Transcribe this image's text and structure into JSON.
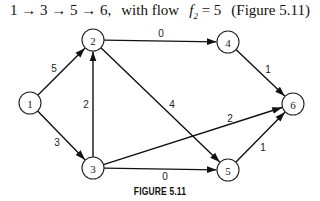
{
  "header": {
    "path": "1 → 3 → 5 → 6,",
    "with_flow_text": "with flow",
    "flow_var": "f",
    "flow_sub": "2",
    "flow_eq": " = 5",
    "figure_ref": "(Figure 5.11)"
  },
  "graph": {
    "nodes": [
      {
        "id": "1",
        "label": "1",
        "x": 30,
        "y": 103
      },
      {
        "id": "2",
        "label": "2",
        "x": 93,
        "y": 40
      },
      {
        "id": "3",
        "label": "3",
        "x": 93,
        "y": 168
      },
      {
        "id": "4",
        "label": "4",
        "x": 228,
        "y": 42
      },
      {
        "id": "5",
        "label": "5",
        "x": 228,
        "y": 170
      },
      {
        "id": "6",
        "label": "6",
        "x": 293,
        "y": 104
      }
    ],
    "edges": [
      {
        "from": "1",
        "to": "2",
        "label": "5"
      },
      {
        "from": "1",
        "to": "3",
        "label": "3"
      },
      {
        "from": "3",
        "to": "2",
        "label": "2"
      },
      {
        "from": "2",
        "to": "4",
        "label": "0"
      },
      {
        "from": "2",
        "to": "5",
        "label": "4"
      },
      {
        "from": "3",
        "to": "6",
        "label": "2"
      },
      {
        "from": "3",
        "to": "5",
        "label": "0"
      },
      {
        "from": "4",
        "to": "6",
        "label": "1"
      },
      {
        "from": "5",
        "to": "6",
        "label": "1"
      }
    ]
  },
  "figure_caption": "FIGURE 5.11"
}
